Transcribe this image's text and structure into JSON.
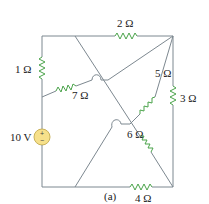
{
  "figure": {
    "caption": "(a)",
    "source": {
      "label": "10 V",
      "polarity_top": "+",
      "polarity_bottom": "−",
      "color": "#f6e08a"
    },
    "resistors": [
      {
        "id": "R1",
        "label": "1 Ω"
      },
      {
        "id": "R2",
        "label": "2 Ω"
      },
      {
        "id": "R3",
        "label": "3 Ω"
      },
      {
        "id": "R4",
        "label": "4 Ω"
      },
      {
        "id": "R5",
        "label": "5 Ω"
      },
      {
        "id": "R6",
        "label": "6 Ω"
      },
      {
        "id": "R7",
        "label": "7 Ω"
      }
    ],
    "colors": {
      "wire": "#7d8890",
      "resistor": "#4aa34a"
    }
  }
}
